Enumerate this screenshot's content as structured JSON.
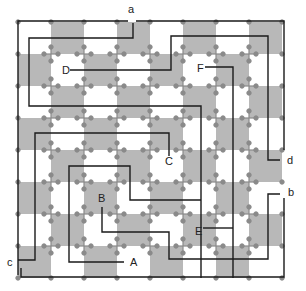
{
  "diagram": {
    "type": "maze",
    "grid": {
      "cols": 8,
      "rows": 8,
      "origin_x": 18,
      "origin_y": 22,
      "cell_w": 33,
      "cell_h": 32
    },
    "colors": {
      "shade": "#b8b8b8",
      "background": "#ffffff",
      "path": "#1a1a1a",
      "node": "#8a8a8a"
    },
    "shaded_cells": [
      [
        0,
        1
      ],
      [
        0,
        3
      ],
      [
        0,
        5
      ],
      [
        0,
        7
      ],
      [
        1,
        0
      ],
      [
        1,
        2
      ],
      [
        1,
        4
      ],
      [
        1,
        6
      ],
      [
        2,
        1
      ],
      [
        2,
        3
      ],
      [
        2,
        5
      ],
      [
        2,
        7
      ],
      [
        3,
        0
      ],
      [
        3,
        2
      ],
      [
        3,
        4
      ],
      [
        3,
        6
      ],
      [
        4,
        1
      ],
      [
        4,
        3
      ],
      [
        4,
        5
      ],
      [
        4,
        7
      ],
      [
        5,
        0
      ],
      [
        5,
        2
      ],
      [
        5,
        4
      ],
      [
        5,
        6
      ],
      [
        6,
        1
      ],
      [
        6,
        3
      ],
      [
        6,
        5
      ],
      [
        6,
        7
      ],
      [
        7,
        0
      ],
      [
        7,
        2
      ],
      [
        7,
        4
      ],
      [
        7,
        6
      ]
    ],
    "terminals": {
      "a": {
        "label": "a",
        "x": 131,
        "y": 14
      },
      "b": {
        "label": "b",
        "x": 289,
        "y": 195
      },
      "c": {
        "label": "c",
        "x": 8,
        "y": 265
      },
      "d": {
        "label": "d",
        "x": 288,
        "y": 163
      }
    },
    "points": {
      "A": {
        "label": "A",
        "x": 131,
        "y": 265
      },
      "B": {
        "label": "B",
        "x": 100,
        "y": 200
      },
      "C": {
        "label": "C",
        "x": 165,
        "y": 164
      },
      "D": {
        "label": "D",
        "x": 62,
        "y": 73
      },
      "E": {
        "label": "E",
        "x": 195,
        "y": 233
      },
      "F": {
        "label": "F",
        "x": 197,
        "y": 71
      }
    },
    "paths": [
      {
        "name": "outer-frame-a-to-c",
        "d": "M128,21 L18,21 L18,275 M128,21 L128,21"
      },
      {
        "name": "a-right-frame",
        "d": "M136,21 L284,21 L284,150"
      },
      {
        "name": "a-inner-loop",
        "d": "M133,23 L133,38 L29,38 L29,106 L201,106 L201,278"
      },
      {
        "name": "D-path",
        "d": "M70,70 L171,70 L171,36 L268,36 L268,160 L280,160"
      },
      {
        "name": "F-path",
        "d": "M205,67 L233,67 L233,278"
      },
      {
        "name": "C-path",
        "d": "M169,156 L169,133 L35,133 L35,260 L18,260"
      },
      {
        "name": "c-bottom-path",
        "d": "M21,268 L21,277 L284,277 L284,198"
      },
      {
        "name": "B-path",
        "d": "M102,207 L102,232 L169,232 L169,259 L268,259 L268,194 L280,194"
      },
      {
        "name": "A-path",
        "d": "M124,262 L69,262 L69,166 L130,166 L130,200 L201,200"
      },
      {
        "name": "E-path",
        "d": "M203,228 L233,228"
      }
    ]
  }
}
